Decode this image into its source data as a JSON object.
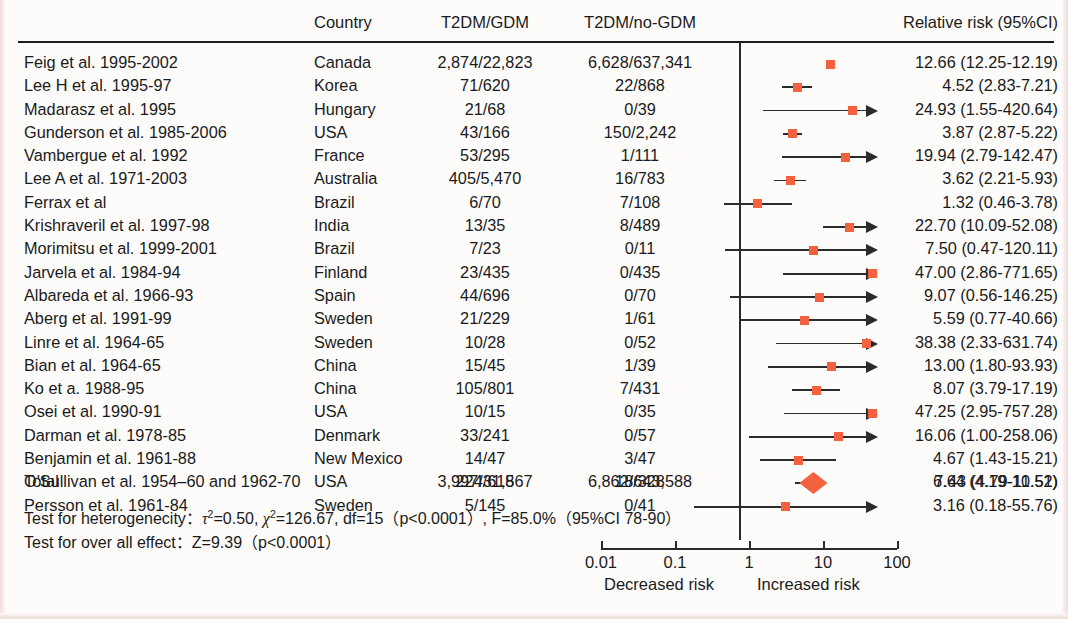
{
  "header": {
    "study_col": "",
    "country_col": "Country",
    "gdm_col": "T2DM/GDM",
    "nogdm_col": "T2DM/no-GDM",
    "rr_col": "Relative risk (95%CI)"
  },
  "chart_data": {
    "type": "forest",
    "title": "",
    "xlabel": "",
    "x_scale": "log",
    "xlim": [
      0.01,
      100
    ],
    "xticks": [
      "0.01",
      "0.1",
      "1",
      "10",
      "100"
    ],
    "xtick_values": [
      0.01,
      0.1,
      1,
      10,
      100
    ],
    "left_caption": "Decreased risk",
    "right_caption": "Increased risk",
    "reference_line": 1,
    "grid": false,
    "marker_color": "#f4613f",
    "line_color": "#2b2b2b",
    "columns": [
      "Study",
      "Country",
      "T2DM/GDM",
      "T2DM/no-GDM",
      "Relative risk (95%CI)"
    ],
    "rows": [
      {
        "study": "Feig et al. 1995-2002",
        "country": "Canada",
        "gdm": "2,874/22,823",
        "nogdm": "6,628/637,341",
        "rr_text": "12.66 (12.25-12.19)",
        "rr": 12.66,
        "lo": 12.25,
        "hi": 12.19,
        "arrow": false
      },
      {
        "study": "Lee H et al. 1995-97",
        "country": "Korea",
        "gdm": "71/620",
        "nogdm": "22/868",
        "rr_text": "4.52 (2.83-7.21)",
        "rr": 4.52,
        "lo": 2.83,
        "hi": 7.21,
        "arrow": false
      },
      {
        "study": "Madarasz et al. 1995",
        "country": "Hungary",
        "gdm": "21/68",
        "nogdm": "0/39",
        "rr_text": "24.93 (1.55-420.64)",
        "rr": 24.93,
        "lo": 1.55,
        "hi": 420.64,
        "arrow": true
      },
      {
        "study": "Gunderson et al. 1985-2006",
        "country": "USA",
        "gdm": "43/166",
        "nogdm": "150/2,242",
        "rr_text": "3.87 (2.87-5.22)",
        "rr": 3.87,
        "lo": 2.87,
        "hi": 5.22,
        "arrow": false
      },
      {
        "study": "Vambergue et al. 1992",
        "country": "France",
        "gdm": "53/295",
        "nogdm": "1/111",
        "rr_text": "19.94 (2.79-142.47)",
        "rr": 19.94,
        "lo": 2.79,
        "hi": 142.47,
        "arrow": true
      },
      {
        "study": "Lee A et al. 1971-2003",
        "country": "Australia",
        "gdm": "405/5,470",
        "nogdm": "16/783",
        "rr_text": "3.62 (2.21-5.93)",
        "rr": 3.62,
        "lo": 2.21,
        "hi": 5.93,
        "arrow": false
      },
      {
        "study": "Ferrax et al",
        "country": "Brazil",
        "gdm": "6/70",
        "nogdm": "7/108",
        "rr_text": "1.32 (0.46-3.78)",
        "rr": 1.32,
        "lo": 0.46,
        "hi": 3.78,
        "arrow": false
      },
      {
        "study": "Krishraveril et al. 1997-98",
        "country": "India",
        "gdm": "13/35",
        "nogdm": "8/489",
        "rr_text": "22.70 (10.09-52.08)",
        "rr": 22.7,
        "lo": 10.09,
        "hi": 52.08,
        "arrow": false
      },
      {
        "study": "Morimitsu et al. 1999-2001",
        "country": "Brazil",
        "gdm": "7/23",
        "nogdm": "0/11",
        "rr_text": "7.50 (0.47-120.11)",
        "rr": 7.5,
        "lo": 0.47,
        "hi": 120.11,
        "arrow": true
      },
      {
        "study": "Jarvela et al. 1984-94",
        "country": "Finland",
        "gdm": "23/435",
        "nogdm": "0/435",
        "rr_text": "47.00 (2.86-771.65)",
        "rr": 47.0,
        "lo": 2.86,
        "hi": 771.65,
        "arrow": true
      },
      {
        "study": "Albareda et al. 1966-93",
        "country": "Spain",
        "gdm": "44/696",
        "nogdm": "0/70",
        "rr_text": "9.07 (0.56-146.25)",
        "rr": 9.07,
        "lo": 0.56,
        "hi": 146.25,
        "arrow": true
      },
      {
        "study": "Aberg et al. 1991-99",
        "country": "Sweden",
        "gdm": "21/229",
        "nogdm": "1/61",
        "rr_text": "5.59 (0.77-40.66)",
        "rr": 5.59,
        "lo": 0.77,
        "hi": 40.66,
        "arrow": false
      },
      {
        "study": "Linre et al. 1964-65",
        "country": "Sweden",
        "gdm": "10/28",
        "nogdm": "0/52",
        "rr_text": "38.38 (2.33-631.74)",
        "rr": 38.38,
        "lo": 2.33,
        "hi": 631.74,
        "arrow": true
      },
      {
        "study": "Bian et al. 1964-65",
        "country": "China",
        "gdm": "15/45",
        "nogdm": "1/39",
        "rr_text": "13.00 (1.80-93.93)",
        "rr": 13.0,
        "lo": 1.8,
        "hi": 93.93,
        "arrow": false
      },
      {
        "study": "Ko et a. 1988-95",
        "country": "China",
        "gdm": "105/801",
        "nogdm": "7/431",
        "rr_text": "8.07 (3.79-17.19)",
        "rr": 8.07,
        "lo": 3.79,
        "hi": 17.19,
        "arrow": false
      },
      {
        "study": "Osei et al. 1990-91",
        "country": "USA",
        "gdm": "10/15",
        "nogdm": "0/35",
        "rr_text": "47.25 (2.95-757.28)",
        "rr": 47.25,
        "lo": 2.95,
        "hi": 757.28,
        "arrow": true
      },
      {
        "study": "Darman et al. 1978-85",
        "country": "Denmark",
        "gdm": "33/241",
        "nogdm": "0/57",
        "rr_text": "16.06 (1.00-258.06)",
        "rr": 16.06,
        "lo": 1.0,
        "hi": 258.06,
        "arrow": true
      },
      {
        "study": "Benjamin et al. 1961-88",
        "country": "New Mexico",
        "gdm": "14/47",
        "nogdm": "3/47",
        "rr_text": "4.67 (1.43-15.21)",
        "rr": 4.67,
        "lo": 1.43,
        "hi": 15.21,
        "arrow": false
      },
      {
        "study": "O'Sullivan et al. 1954–60 and 1962-70",
        "country": "USA",
        "gdm": "224/615",
        "nogdm": "18/328",
        "rr_text": "6.64 (4.19-10.52)",
        "rr": 6.64,
        "lo": 4.19,
        "hi": 10.52,
        "arrow": false
      },
      {
        "study": "Persson et al. 1961-84",
        "country": "Sweden",
        "gdm": "5/145",
        "nogdm": "0/41",
        "rr_text": "3.16 (0.18-55.76)",
        "rr": 3.16,
        "lo": 0.18,
        "hi": 55.76,
        "arrow": false
      }
    ],
    "total": {
      "label": "Total",
      "gdm": "3,997/31,867",
      "nogdm": "6,862/643,588",
      "rr_text": "7.43 (4.79-11.51)",
      "rr": 7.43,
      "lo": 4.79,
      "hi": 11.51
    }
  },
  "notes": {
    "heterogeneity_prefix": "Test for heterogenecity：",
    "heterogeneity_body": "=0.50,",
    "heterogeneity_chi": "=126.67, df=15（p<0.0001）, F=85.0%（95%CI 78-90）",
    "tau_symbol": "τ",
    "chi_symbol": "χ",
    "sup": "2",
    "overall_effect": "Test for over all effect：Z=9.39（p<0.0001）"
  }
}
